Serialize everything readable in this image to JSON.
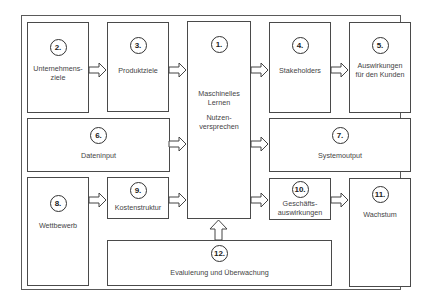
{
  "diagram": {
    "type": "flow-block-diagram",
    "boxes": [
      {
        "id": "1",
        "number": "1.",
        "label": "Maschinelles\nLernen",
        "label2": "Nutzen-\nversprechen"
      },
      {
        "id": "2",
        "number": "2.",
        "label": "Unternehmens-\nziele"
      },
      {
        "id": "3",
        "number": "3.",
        "label": "Produktziele"
      },
      {
        "id": "4",
        "number": "4.",
        "label": "Stakeholders"
      },
      {
        "id": "5",
        "number": "5.",
        "label": "Auswirkungen\nfür den Kunden"
      },
      {
        "id": "6",
        "number": "6.",
        "label": "Dateninput"
      },
      {
        "id": "7",
        "number": "7.",
        "label": "Systemoutput"
      },
      {
        "id": "8",
        "number": "8.",
        "label": "Wettbewerb"
      },
      {
        "id": "9",
        "number": "9.",
        "label": "Kostenstruktur"
      },
      {
        "id": "10",
        "number": "10.",
        "label": "Geschäfts-\nauswirkungen"
      },
      {
        "id": "11",
        "number": "11.",
        "label": "Wachstum"
      },
      {
        "id": "12",
        "number": "12.",
        "label": "Evaluierung und Überwachung"
      }
    ],
    "arrows": [
      {
        "from": "2",
        "to": "3"
      },
      {
        "from": "3",
        "to": "1"
      },
      {
        "from": "1",
        "to": "4"
      },
      {
        "from": "4",
        "to": "5"
      },
      {
        "from": "6",
        "to": "1"
      },
      {
        "from": "1",
        "to": "7"
      },
      {
        "from": "8",
        "to": "9"
      },
      {
        "from": "9",
        "to": "1"
      },
      {
        "from": "1",
        "to": "10"
      },
      {
        "from": "10",
        "to": "11"
      },
      {
        "from": "12",
        "to": "1"
      }
    ]
  }
}
